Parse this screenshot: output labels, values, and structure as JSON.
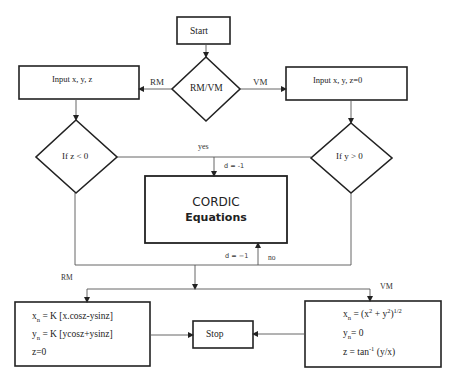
{
  "diagram": {
    "nodes": {
      "start": {
        "label": "Start",
        "shape": "rectangle"
      },
      "mode_decision": {
        "label": "RM/VM",
        "shape": "diamond"
      },
      "input_rm": {
        "label": "Input  x,  y,  z",
        "shape": "rectangle"
      },
      "input_vm": {
        "label": "Input  x,  y,  z=0",
        "shape": "rectangle"
      },
      "decision_z": {
        "label": "If z < 0",
        "shape": "diamond"
      },
      "decision_y": {
        "label": "If y > 0",
        "shape": "diamond"
      },
      "cordic": {
        "line1": "CORDIC",
        "line2": "Equations",
        "shape": "rectangle"
      },
      "output_rm": {
        "shape": "rectangle",
        "lines": [
          {
            "var": "x",
            "sub": "n",
            "expr": " = K  [x.cosz-ysinz]"
          },
          {
            "var": "y",
            "sub": "n",
            "expr": " = K  [ycosz+ysinz]"
          },
          {
            "var": "z=0",
            "sub": "",
            "expr": ""
          }
        ]
      },
      "stop": {
        "label": "Stop",
        "shape": "rectangle"
      },
      "output_vm": {
        "shape": "rectangle",
        "line1": {
          "var": "x",
          "sub": "n",
          "pre": " = (x",
          "sup1": "2",
          "mid": " + y",
          "sup2": "2",
          "post": ")",
          "sup3": "1/2"
        },
        "line2": {
          "var": "y",
          "sub": "n",
          "expr": "= 0"
        },
        "line3": {
          "pre": "z = tan",
          "sup": "-1",
          "post": " (y/x)"
        }
      }
    },
    "edge_labels": {
      "rm_top": "RM",
      "vm_top": "VM",
      "yes": "yes",
      "d_top": "d = -1",
      "d_bottom": "d = −1",
      "no": "no",
      "rm_bottom": "RM",
      "vm_bottom": "VM"
    },
    "colors": {
      "stroke": "#222222",
      "thin_line": "#555555",
      "background": "#ffffff"
    }
  }
}
